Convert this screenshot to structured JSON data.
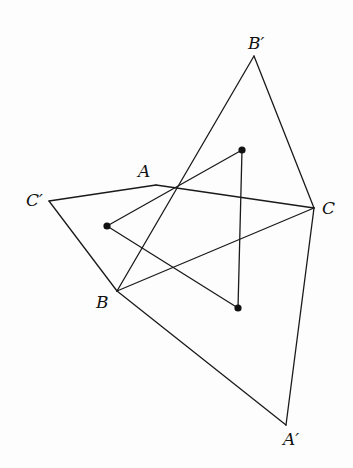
{
  "diagram": {
    "type": "geometry",
    "points": {
      "A": [
        156,
        185
      ],
      "B": [
        117,
        291
      ],
      "C": [
        314,
        208
      ],
      "A'": [
        286,
        425
      ],
      "B'": [
        254,
        56
      ],
      "C'": [
        49,
        201
      ],
      "P1": [
        242,
        150
      ],
      "P2": [
        107,
        226
      ],
      "P3": [
        238,
        308
      ]
    },
    "segments": [
      [
        "B'",
        "B"
      ],
      [
        "B'",
        "C"
      ],
      [
        "C",
        "A'"
      ],
      [
        "B",
        "A'"
      ],
      [
        "C'",
        "A"
      ],
      [
        "A",
        "C"
      ],
      [
        "C'",
        "B"
      ],
      [
        "B",
        "C"
      ],
      [
        "P1",
        "P2"
      ],
      [
        "P2",
        "P3"
      ],
      [
        "P3",
        "P1"
      ]
    ],
    "labels": [
      {
        "id": "A",
        "text": "A",
        "x": 138,
        "y": 163
      },
      {
        "id": "B",
        "text": "B",
        "x": 96,
        "y": 294
      },
      {
        "id": "C",
        "text": "C",
        "x": 322,
        "y": 200
      },
      {
        "id": "A'",
        "text": "A′",
        "x": 283,
        "y": 431
      },
      {
        "id": "B'",
        "text": "B′",
        "x": 248,
        "y": 35
      },
      {
        "id": "C'",
        "text": "C′",
        "x": 26,
        "y": 192
      }
    ],
    "colors": {
      "line": "#1a1a1a",
      "dot": "#111111",
      "background": "#fdfdfd"
    }
  }
}
